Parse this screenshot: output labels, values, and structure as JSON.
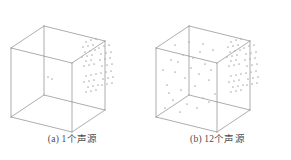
{
  "figure": {
    "background_color": "#ffffff",
    "line_color": "#8a8a8a",
    "dot_color": "#b0b0b0",
    "caption_color": "#4a4a4a",
    "panels": [
      {
        "id": "panel-a",
        "caption": "(a) 1个声源",
        "label": "(a)",
        "source_count_text": "1个声源"
      },
      {
        "id": "panel-b",
        "caption": "(b) 12个声源",
        "label": "(b)",
        "source_count_text": "12个声源"
      }
    ]
  },
  "chart_data": {
    "type": "scatter",
    "title": "",
    "subtitle": "",
    "xlabel": "",
    "ylabel": "",
    "grid": false,
    "legend": "none",
    "panels": [
      {
        "name": "(a) 1个声源",
        "sources": 1,
        "box": {
          "front_bottom_left": [
            11,
            117
          ],
          "front_bottom_right": [
            72,
            132
          ],
          "front_top_left": [
            11,
            48
          ],
          "front_top_right": [
            72,
            63
          ],
          "back_bottom_left": [
            44,
            95
          ],
          "back_bottom_right": [
            105,
            110
          ],
          "back_top_left": [
            44,
            26
          ],
          "back_top_right": [
            105,
            41
          ]
        },
        "points": [
          [
            86,
            42
          ],
          [
            91,
            40
          ],
          [
            96,
            39
          ],
          [
            83,
            47
          ],
          [
            88,
            46
          ],
          [
            93,
            45
          ],
          [
            85,
            52
          ],
          [
            90,
            51
          ],
          [
            95,
            50
          ],
          [
            82,
            57
          ],
          [
            87,
            56
          ],
          [
            92,
            55
          ],
          [
            86,
            61
          ],
          [
            91,
            60
          ],
          [
            84,
            66
          ],
          [
            89,
            65
          ],
          [
            94,
            64
          ],
          [
            99,
            48
          ],
          [
            104,
            46
          ],
          [
            109,
            45
          ],
          [
            101,
            54
          ],
          [
            106,
            53
          ],
          [
            111,
            52
          ],
          [
            100,
            60
          ],
          [
            105,
            59
          ],
          [
            110,
            58
          ],
          [
            102,
            66
          ],
          [
            107,
            65
          ],
          [
            112,
            64
          ],
          [
            86,
            76
          ],
          [
            91,
            75
          ],
          [
            96,
            74
          ],
          [
            84,
            82
          ],
          [
            89,
            81
          ],
          [
            94,
            80
          ],
          [
            88,
            87
          ],
          [
            93,
            86
          ],
          [
            98,
            85
          ],
          [
            86,
            92
          ],
          [
            91,
            91
          ],
          [
            96,
            90
          ],
          [
            101,
            73
          ],
          [
            106,
            72
          ],
          [
            111,
            71
          ],
          [
            103,
            79
          ],
          [
            108,
            78
          ],
          [
            113,
            77
          ],
          [
            102,
            85
          ],
          [
            107,
            84
          ],
          [
            112,
            83
          ],
          [
            48,
            77
          ],
          [
            52,
            79
          ]
        ]
      },
      {
        "name": "(b) 12个声源",
        "sources": 12,
        "box": {
          "front_bottom_left": [
            11,
            117
          ],
          "front_bottom_right": [
            72,
            132
          ],
          "front_top_left": [
            11,
            48
          ],
          "front_top_right": [
            72,
            63
          ],
          "back_bottom_left": [
            44,
            95
          ],
          "back_bottom_right": [
            105,
            110
          ],
          "back_top_left": [
            44,
            26
          ],
          "back_top_right": [
            105,
            41
          ]
        },
        "points": [
          [
            86,
            42
          ],
          [
            91,
            40
          ],
          [
            96,
            39
          ],
          [
            83,
            47
          ],
          [
            88,
            46
          ],
          [
            93,
            45
          ],
          [
            85,
            52
          ],
          [
            90,
            51
          ],
          [
            95,
            50
          ],
          [
            82,
            57
          ],
          [
            87,
            56
          ],
          [
            92,
            55
          ],
          [
            86,
            61
          ],
          [
            91,
            60
          ],
          [
            84,
            66
          ],
          [
            89,
            65
          ],
          [
            94,
            64
          ],
          [
            99,
            48
          ],
          [
            104,
            46
          ],
          [
            109,
            45
          ],
          [
            101,
            54
          ],
          [
            106,
            53
          ],
          [
            111,
            52
          ],
          [
            100,
            60
          ],
          [
            105,
            59
          ],
          [
            110,
            58
          ],
          [
            102,
            66
          ],
          [
            107,
            65
          ],
          [
            112,
            64
          ],
          [
            86,
            76
          ],
          [
            91,
            75
          ],
          [
            96,
            74
          ],
          [
            84,
            82
          ],
          [
            89,
            81
          ],
          [
            94,
            80
          ],
          [
            88,
            87
          ],
          [
            93,
            86
          ],
          [
            98,
            85
          ],
          [
            86,
            92
          ],
          [
            91,
            91
          ],
          [
            96,
            90
          ],
          [
            101,
            73
          ],
          [
            106,
            72
          ],
          [
            111,
            71
          ],
          [
            103,
            79
          ],
          [
            108,
            78
          ],
          [
            113,
            77
          ],
          [
            102,
            85
          ],
          [
            107,
            84
          ],
          [
            112,
            83
          ],
          [
            26,
            60
          ],
          [
            38,
            55
          ],
          [
            55,
            52
          ],
          [
            68,
            50
          ],
          [
            30,
            72
          ],
          [
            46,
            68
          ],
          [
            60,
            64
          ],
          [
            22,
            85
          ],
          [
            36,
            90
          ],
          [
            50,
            86
          ],
          [
            64,
            80
          ],
          [
            28,
            100
          ],
          [
            42,
            104
          ],
          [
            58,
            98
          ],
          [
            70,
            94
          ],
          [
            18,
            70
          ],
          [
            33,
            62
          ],
          [
            48,
            58
          ],
          [
            24,
            93
          ],
          [
            40,
            78
          ],
          [
            54,
            74
          ],
          [
            66,
            70
          ],
          [
            20,
            108
          ],
          [
            35,
            112
          ],
          [
            52,
            108
          ],
          [
            64,
            102
          ],
          [
            30,
            45
          ],
          [
            44,
            42
          ],
          [
            58,
            44
          ]
        ]
      }
    ]
  }
}
